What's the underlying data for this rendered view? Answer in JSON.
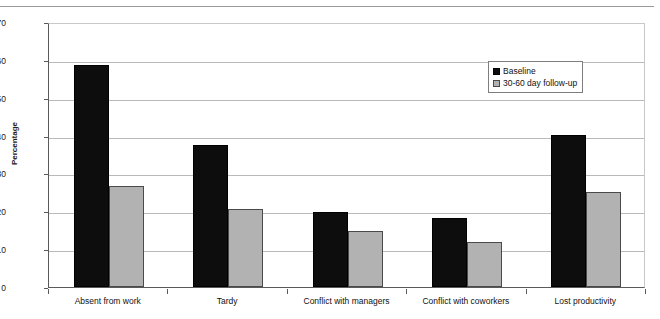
{
  "header": {
    "clipped_text": "",
    "rule": "horizontal-rule"
  },
  "chart_data": {
    "type": "bar",
    "title": "",
    "xlabel": "",
    "ylabel": "Percentage",
    "ylim": [
      0,
      70
    ],
    "yticks": [
      0,
      10,
      20,
      30,
      40,
      50,
      60,
      70
    ],
    "ytick_labels": [
      "0",
      "10",
      "20",
      "30",
      "40",
      "50",
      "60",
      "70"
    ],
    "grid": true,
    "legend_position": "upper right",
    "categories": [
      "Absent from work",
      "Tardy",
      "Conflict with managers",
      "Conflict with coworkers",
      "Lost productivity"
    ],
    "series": [
      {
        "name": "Baseline",
        "color": "#0d0d0d",
        "values": [
          58.6,
          37.4,
          19.8,
          18.1,
          40.1
        ]
      },
      {
        "name": "30-60 day follow-up",
        "color": "#b2b2b2",
        "values": [
          26.7,
          20.5,
          14.9,
          11.9,
          25.2
        ]
      }
    ]
  },
  "legend": {
    "items": [
      {
        "label": "Baseline",
        "swatch": "black-square"
      },
      {
        "label": "30-60 day follow-up",
        "swatch": "gray-square"
      }
    ]
  }
}
